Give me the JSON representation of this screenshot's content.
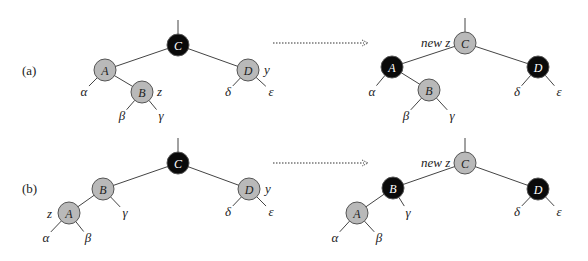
{
  "colors": {
    "red_node": "#b9b9b9",
    "black_node": "#0a0a0a",
    "edge": "#444444"
  },
  "cases": [
    {
      "label": "(a)",
      "before": {
        "nodes": [
          {
            "id": "C",
            "x": 178,
            "y": 45,
            "color": "black"
          },
          {
            "id": "A",
            "x": 105,
            "y": 70,
            "color": "red"
          },
          {
            "id": "B",
            "x": 142,
            "y": 92,
            "color": "red"
          },
          {
            "id": "D",
            "x": 248,
            "y": 70,
            "color": "red"
          }
        ],
        "edges": [
          [
            "C",
            "A"
          ],
          [
            "C",
            "D"
          ],
          [
            "A",
            "B"
          ]
        ],
        "annotations": [
          {
            "text": "z",
            "x": 157,
            "y": 96
          },
          {
            "text": "y",
            "x": 264,
            "y": 74
          }
        ],
        "leaves": [
          {
            "text": "α",
            "x": 84,
            "y": 96,
            "from": "A"
          },
          {
            "text": "β",
            "x": 122,
            "y": 120,
            "from": "B"
          },
          {
            "text": "γ",
            "x": 161,
            "y": 120,
            "from": "B"
          },
          {
            "text": "δ",
            "x": 228,
            "y": 96,
            "from": "D"
          },
          {
            "text": "ε",
            "x": 271,
            "y": 96,
            "from": "D"
          }
        ]
      },
      "after": {
        "nodes": [
          {
            "id": "C",
            "x": 465,
            "y": 43,
            "color": "red"
          },
          {
            "id": "A",
            "x": 392,
            "y": 67,
            "color": "black"
          },
          {
            "id": "B",
            "x": 429,
            "y": 90,
            "color": "red"
          },
          {
            "id": "D",
            "x": 538,
            "y": 67,
            "color": "black"
          }
        ],
        "edges": [
          [
            "C",
            "A"
          ],
          [
            "C",
            "D"
          ],
          [
            "A",
            "B"
          ]
        ],
        "annotations": [
          {
            "text": "new z",
            "x": 421,
            "y": 47
          }
        ],
        "leaves": [
          {
            "text": "α",
            "x": 372,
            "y": 96,
            "from": "A"
          },
          {
            "text": "β",
            "x": 406,
            "y": 120,
            "from": "B"
          },
          {
            "text": "γ",
            "x": 452,
            "y": 120,
            "from": "B"
          },
          {
            "text": "δ",
            "x": 517,
            "y": 96,
            "from": "D"
          },
          {
            "text": "ε",
            "x": 559,
            "y": 96,
            "from": "D"
          }
        ]
      },
      "arrow": {
        "x1": 273,
        "y": 43,
        "x2": 368
      }
    },
    {
      "label": "(b)",
      "before": {
        "nodes": [
          {
            "id": "C",
            "x": 178,
            "y": 163,
            "color": "black"
          },
          {
            "id": "B",
            "x": 103,
            "y": 189,
            "color": "red"
          },
          {
            "id": "A",
            "x": 69,
            "y": 213,
            "color": "red"
          },
          {
            "id": "D",
            "x": 249,
            "y": 189,
            "color": "red"
          }
        ],
        "edges": [
          [
            "C",
            "B"
          ],
          [
            "C",
            "D"
          ],
          [
            "B",
            "A"
          ]
        ],
        "annotations": [
          {
            "text": "z",
            "x": 47,
            "y": 218
          },
          {
            "text": "y",
            "x": 265,
            "y": 193
          }
        ],
        "leaves": [
          {
            "text": "γ",
            "x": 125,
            "y": 217,
            "from": "B"
          },
          {
            "text": "α",
            "x": 46,
            "y": 242,
            "from": "A"
          },
          {
            "text": "β",
            "x": 88,
            "y": 242,
            "from": "A"
          },
          {
            "text": "δ",
            "x": 228,
            "y": 216,
            "from": "D"
          },
          {
            "text": "ε",
            "x": 271,
            "y": 216,
            "from": "D"
          }
        ]
      },
      "after": {
        "nodes": [
          {
            "id": "C",
            "x": 465,
            "y": 163,
            "color": "red"
          },
          {
            "id": "B",
            "x": 393,
            "y": 188,
            "color": "black"
          },
          {
            "id": "A",
            "x": 357,
            "y": 213,
            "color": "red"
          },
          {
            "id": "D",
            "x": 538,
            "y": 189,
            "color": "black"
          }
        ],
        "edges": [
          [
            "C",
            "B"
          ],
          [
            "C",
            "D"
          ],
          [
            "B",
            "A"
          ]
        ],
        "annotations": [
          {
            "text": "new z",
            "x": 421,
            "y": 167
          }
        ],
        "leaves": [
          {
            "text": "γ",
            "x": 408,
            "y": 217,
            "from": "B"
          },
          {
            "text": "α",
            "x": 335,
            "y": 242,
            "from": "A"
          },
          {
            "text": "β",
            "x": 379,
            "y": 242,
            "from": "A"
          },
          {
            "text": "δ",
            "x": 517,
            "y": 216,
            "from": "D"
          },
          {
            "text": "ε",
            "x": 559,
            "y": 216,
            "from": "D"
          }
        ]
      },
      "arrow": {
        "x1": 273,
        "y": 163,
        "x2": 368
      }
    }
  ]
}
